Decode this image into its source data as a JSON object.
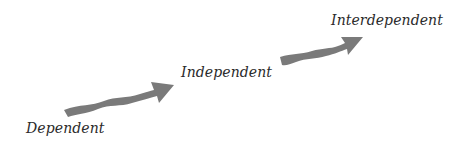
{
  "diagram": {
    "type": "progression",
    "stages": [
      {
        "label": "Dependent"
      },
      {
        "label": "Independent"
      },
      {
        "label": "Interdependent"
      }
    ],
    "arrow_color": "#7a7a7a",
    "text_color": "#2b2b2b"
  }
}
